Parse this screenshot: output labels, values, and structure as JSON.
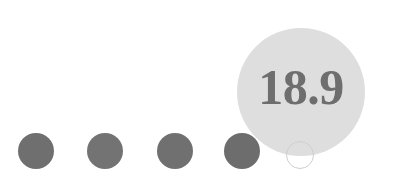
{
  "figure": {
    "type": "dot-plot",
    "background_color": "#ffffff",
    "width": 400,
    "height": 182
  },
  "chart_data": {
    "type": "scatter",
    "title": "",
    "subtitle": "",
    "xlabel": "",
    "ylabel": "",
    "annotations": [
      "18.9"
    ],
    "legend": [],
    "grid": false,
    "series": [
      {
        "name": "scale-dots",
        "marker": "filled-circle",
        "color": "#6f6f6f",
        "values": [
          1,
          1,
          1,
          1
        ],
        "x": [
          36,
          105,
          175,
          242
        ],
        "y": [
          151,
          151,
          151,
          151
        ],
        "marker_size": 36
      },
      {
        "name": "highlighted-value",
        "marker": "filled-circle",
        "color": "#dedede",
        "label": "18.9",
        "value": 18.9,
        "x": [
          301
        ],
        "y": [
          92
        ],
        "marker_size": 128
      },
      {
        "name": "ghost-dot",
        "marker": "outlined-circle",
        "color": "#cfcfcf",
        "x": [
          300
        ],
        "y": [
          155
        ],
        "marker_size": 28
      }
    ]
  },
  "dots": [
    {
      "label": "dot-1",
      "cx": 36,
      "cy": 151,
      "d": 36,
      "color": "#6f6f6f"
    },
    {
      "label": "dot-2",
      "cx": 105,
      "cy": 151,
      "d": 36,
      "color": "#737373"
    },
    {
      "label": "dot-3",
      "cx": 175,
      "cy": 151,
      "d": 36,
      "color": "#707070"
    },
    {
      "label": "dot-4",
      "cx": 242,
      "cy": 151,
      "d": 36,
      "color": "#6d6d6d"
    }
  ],
  "bubble": {
    "value_text": "18.9",
    "cx": 301,
    "cy": 92,
    "d": 128,
    "fill": "#dedede",
    "text_color": "#6e6e6e",
    "font_size": 50
  },
  "ghost_dot": {
    "cx": 300,
    "cy": 155,
    "d": 28,
    "stroke": "#cfcfcf"
  }
}
